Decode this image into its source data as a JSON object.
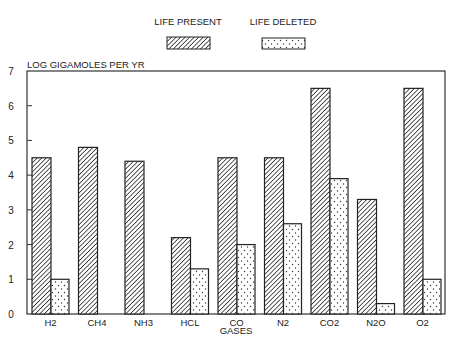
{
  "chart_data": {
    "type": "bar",
    "title": "",
    "xlabel": "GASES",
    "ylabel": "LOG GIGAMOLES PER YR",
    "ylim": [
      0,
      7
    ],
    "yticks": [
      0,
      1,
      2,
      3,
      4,
      5,
      6,
      7
    ],
    "grid": false,
    "legend_position": "top-center",
    "categories": [
      "H2",
      "CH4",
      "NH3",
      "HCL",
      "CO",
      "N2",
      "CO2",
      "N2O",
      "O2"
    ],
    "series": [
      {
        "name": "LIFE PRESENT",
        "pattern": "diagonal-hatch",
        "values": [
          4.5,
          4.8,
          4.4,
          2.2,
          4.5,
          4.5,
          6.5,
          3.3,
          6.5
        ]
      },
      {
        "name": "LIFE DELETED",
        "pattern": "dots",
        "values": [
          1.0,
          null,
          null,
          1.3,
          2.0,
          2.6,
          3.9,
          0.3,
          1.0
        ]
      }
    ]
  },
  "colors": {
    "ink": "#222222",
    "background": "#ffffff"
  }
}
